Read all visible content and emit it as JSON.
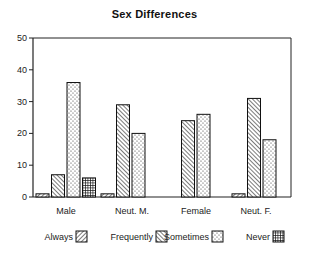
{
  "chart_data": {
    "type": "bar",
    "title": "Sex Differences",
    "xlabel": "",
    "ylabel": "",
    "ylim": [
      0,
      50
    ],
    "yticks": [
      0,
      10,
      20,
      30,
      40,
      50
    ],
    "grid": false,
    "legend_position": "bottom",
    "categories": [
      "Male",
      "Neut. M.",
      "Female",
      "Neut. F."
    ],
    "series": [
      {
        "name": "Always",
        "pattern": "forward-hatch",
        "values": [
          1,
          1,
          0,
          1
        ]
      },
      {
        "name": "Frequently",
        "pattern": "backward-hatch",
        "values": [
          7,
          29,
          24,
          31
        ]
      },
      {
        "name": "Sometimes",
        "pattern": "dots",
        "values": [
          36,
          20,
          26,
          18
        ]
      },
      {
        "name": "Never",
        "pattern": "crosshatch-dark",
        "values": [
          6,
          0,
          0,
          0
        ]
      }
    ]
  },
  "title": "Sex Differences",
  "legend": [
    "Always",
    "Frequently",
    "Sometimes",
    "Never"
  ],
  "colors": {
    "ink": "#111111",
    "background": "#ffffff"
  }
}
